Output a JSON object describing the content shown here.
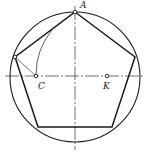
{
  "diagram": {
    "colors": {
      "stroke": "#1a1a1a",
      "background": "#ffffff"
    },
    "circle": {
      "cx": 75,
      "cy": 77,
      "r": 65
    },
    "centerlines": {
      "horizontal": {
        "x1": 5,
        "y1": 76,
        "x2": 145,
        "y2": 76
      },
      "vertical": {
        "x1": 75,
        "y1": 6,
        "x2": 75,
        "y2": 150
      }
    },
    "pentagon": {
      "points": [
        [
          75,
          12
        ],
        [
          135,
          57
        ],
        [
          112,
          127
        ],
        [
          38,
          127
        ],
        [
          15,
          57
        ]
      ]
    },
    "arc": {
      "from": [
        36,
        76
      ],
      "to": [
        52,
        30
      ],
      "radius": 71,
      "center_label": "K"
    },
    "construction_line": {
      "from": [
        15,
        57
      ],
      "to": [
        36,
        76
      ]
    },
    "labels": [
      {
        "id": "A",
        "text": "A",
        "x": 80,
        "y": 1
      },
      {
        "id": "C",
        "text": "C",
        "x": 38,
        "y": 82
      },
      {
        "id": "K",
        "text": "K",
        "x": 103,
        "y": 82
      }
    ],
    "points": [
      {
        "id": "A",
        "x": 75,
        "y": 12
      },
      {
        "id": "left-vertex",
        "x": 15,
        "y": 57
      },
      {
        "id": "C",
        "x": 36,
        "y": 76
      },
      {
        "id": "K",
        "x": 107,
        "y": 76
      }
    ]
  }
}
